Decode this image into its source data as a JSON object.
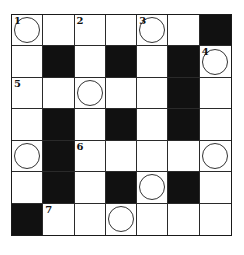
{
  "puzzle": {
    "type": "crossword",
    "rows": 7,
    "cols": 7,
    "colors": {
      "black": "#111111",
      "white": "#ffffff",
      "line": "#2a2a2a"
    },
    "cells": [
      [
        {
          "t": "w",
          "n": "1",
          "c": true
        },
        {
          "t": "w"
        },
        {
          "t": "w",
          "n": "2"
        },
        {
          "t": "w"
        },
        {
          "t": "w",
          "n": "3",
          "c": true
        },
        {
          "t": "w"
        },
        {
          "t": "b"
        }
      ],
      [
        {
          "t": "w"
        },
        {
          "t": "b"
        },
        {
          "t": "w"
        },
        {
          "t": "b"
        },
        {
          "t": "w"
        },
        {
          "t": "b"
        },
        {
          "t": "w",
          "n": "4",
          "c": true
        }
      ],
      [
        {
          "t": "w",
          "n": "5"
        },
        {
          "t": "w"
        },
        {
          "t": "w",
          "c": true
        },
        {
          "t": "w"
        },
        {
          "t": "w"
        },
        {
          "t": "b"
        },
        {
          "t": "w"
        }
      ],
      [
        {
          "t": "w"
        },
        {
          "t": "b"
        },
        {
          "t": "w"
        },
        {
          "t": "b"
        },
        {
          "t": "w"
        },
        {
          "t": "b"
        },
        {
          "t": "w"
        }
      ],
      [
        {
          "t": "w",
          "c": true
        },
        {
          "t": "b"
        },
        {
          "t": "w",
          "n": "6"
        },
        {
          "t": "w"
        },
        {
          "t": "w"
        },
        {
          "t": "w"
        },
        {
          "t": "w",
          "c": true
        }
      ],
      [
        {
          "t": "w"
        },
        {
          "t": "b"
        },
        {
          "t": "w"
        },
        {
          "t": "b"
        },
        {
          "t": "w",
          "c": true
        },
        {
          "t": "b"
        },
        {
          "t": "w"
        }
      ],
      [
        {
          "t": "b"
        },
        {
          "t": "w",
          "n": "7"
        },
        {
          "t": "w"
        },
        {
          "t": "w",
          "c": true
        },
        {
          "t": "w"
        },
        {
          "t": "w"
        },
        {
          "t": "w"
        }
      ]
    ]
  }
}
